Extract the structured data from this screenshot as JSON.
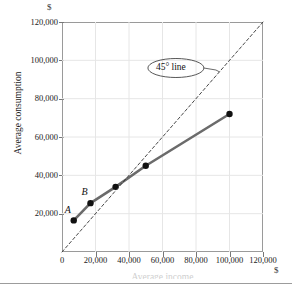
{
  "figure": {
    "y_unit_symbol": "$",
    "x_unit_symbol": "$",
    "y_axis_title": "Average consumption",
    "x_axis_title": "Average income",
    "callout_label": "45° line",
    "point_labels": [
      {
        "id": "A",
        "text": "A"
      },
      {
        "id": "B",
        "text": "B"
      }
    ]
  },
  "chart_data": {
    "type": "line",
    "title": "",
    "xlabel": "Average income",
    "ylabel": "Average consumption",
    "xlim": [
      0,
      120000
    ],
    "ylim": [
      0,
      120000
    ],
    "grid": true,
    "legend_position": "none",
    "x_ticks": [
      0,
      20000,
      40000,
      60000,
      80000,
      100000,
      120000
    ],
    "x_tick_labels": [
      "0",
      "20,000",
      "40,000",
      "60,000",
      "80,000",
      "100,000",
      "120,000"
    ],
    "y_ticks": [
      20000,
      40000,
      60000,
      80000,
      100000,
      120000
    ],
    "y_tick_labels": [
      "20,000",
      "40,000",
      "60,000",
      "80,000",
      "100,000",
      "120,000"
    ],
    "x_unit": "$",
    "y_unit": "$",
    "series": [
      {
        "name": "Average consumption",
        "style": "solid",
        "color": "#6b6b6b",
        "markers": true,
        "points": [
          {
            "x": 7000,
            "y": 16500,
            "label": "A"
          },
          {
            "x": 17000,
            "y": 25500,
            "label": "B"
          },
          {
            "x": 32000,
            "y": 34000,
            "label": ""
          },
          {
            "x": 50000,
            "y": 45000,
            "label": ""
          },
          {
            "x": 100000,
            "y": 72000,
            "label": ""
          }
        ]
      },
      {
        "name": "45° line",
        "style": "dashed",
        "color": "#333333",
        "markers": false,
        "points": [
          {
            "x": 0,
            "y": 0,
            "label": ""
          },
          {
            "x": 120000,
            "y": 120000,
            "label": ""
          }
        ]
      }
    ],
    "annotations": [
      {
        "text": "45° line",
        "x": 68000,
        "y": 96000,
        "shape": "ellipse",
        "leader_to_x": 94000,
        "leader_to_y": 94000
      }
    ]
  }
}
